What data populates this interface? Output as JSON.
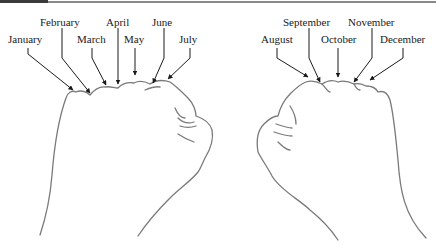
{
  "diagram": {
    "left_hand": {
      "labels": [
        {
          "id": "jan",
          "text": "January",
          "x": 8,
          "y": 33
        },
        {
          "id": "feb",
          "text": "February",
          "x": 40,
          "y": 16
        },
        {
          "id": "mar",
          "text": "March",
          "x": 77,
          "y": 33
        },
        {
          "id": "apr",
          "text": "April",
          "x": 106,
          "y": 16
        },
        {
          "id": "may",
          "text": "May",
          "x": 124,
          "y": 33
        },
        {
          "id": "jun",
          "text": "June",
          "x": 152,
          "y": 16
        },
        {
          "id": "jul",
          "text": "July",
          "x": 179,
          "y": 33
        }
      ]
    },
    "right_hand": {
      "labels": [
        {
          "id": "aug",
          "text": "August",
          "x": 261,
          "y": 33
        },
        {
          "id": "sep",
          "text": "September",
          "x": 283,
          "y": 16
        },
        {
          "id": "oct",
          "text": "October",
          "x": 321,
          "y": 33
        },
        {
          "id": "nov",
          "text": "November",
          "x": 348,
          "y": 16
        },
        {
          "id": "dec",
          "text": "December",
          "x": 380,
          "y": 33
        }
      ]
    },
    "colors": {
      "line": "#6b6b6b",
      "arrow": "#1a1a1a",
      "text": "#1a1a1a"
    }
  }
}
